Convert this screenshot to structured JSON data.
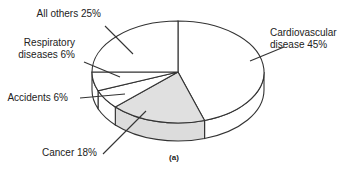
{
  "chart_data": {
    "type": "pie",
    "style": "3d",
    "start": "top",
    "direction": "clockwise",
    "caption": "(a)",
    "slices": [
      {
        "label_lines": [
          "Cardiovascular",
          "disease  45%"
        ],
        "name": "Cardiovascular disease",
        "value": 45,
        "color": "#ffffff"
      },
      {
        "label_lines": [
          "Cancer 18%"
        ],
        "name": "Cancer",
        "value": 18,
        "color": "#e0e0e0"
      },
      {
        "label_lines": [
          "Accidents 6%"
        ],
        "name": "Accidents",
        "value": 6,
        "color": "#ffffff"
      },
      {
        "label_lines": [
          "Respiratory",
          "diseases 6%"
        ],
        "name": "Respiratory diseases",
        "value": 6,
        "color": "#ffffff"
      },
      {
        "label_lines": [
          "All others 25%"
        ],
        "name": "All others",
        "value": 25,
        "color": "#ffffff"
      }
    ],
    "stroke_color": "#333333"
  }
}
